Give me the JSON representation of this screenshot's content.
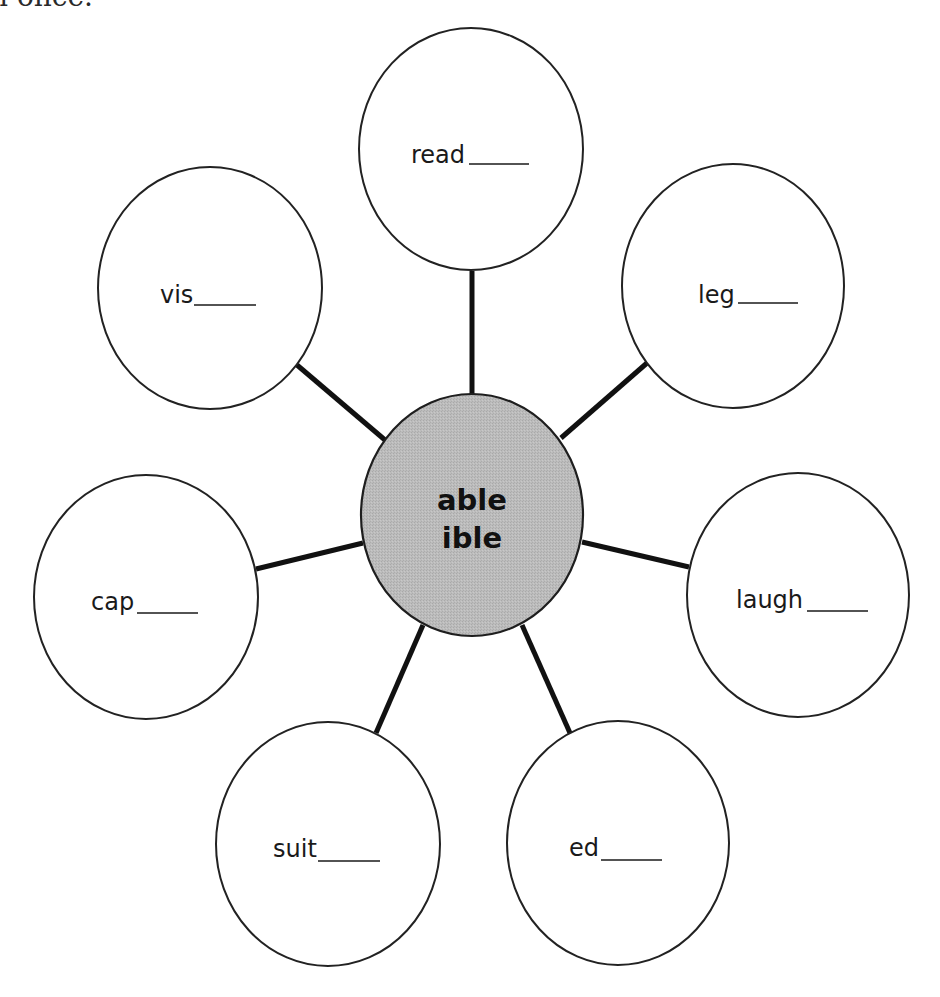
{
  "page": {
    "top_fragment_text": "n once."
  },
  "diagram": {
    "type": "word-web",
    "center": {
      "lines": [
        "able",
        "ible"
      ],
      "fill_color": "#b8b8b8"
    },
    "leaves": [
      {
        "id": "read",
        "stem": "read",
        "blank": "____"
      },
      {
        "id": "leg",
        "stem": "leg",
        "blank": "____"
      },
      {
        "id": "laugh",
        "stem": "laugh",
        "blank": "____"
      },
      {
        "id": "ed",
        "stem": "ed",
        "blank": "____"
      },
      {
        "id": "suit",
        "stem": "suit",
        "blank": "____"
      },
      {
        "id": "cap",
        "stem": "cap",
        "blank": "____"
      },
      {
        "id": "vis",
        "stem": "vis",
        "blank": "____"
      }
    ]
  }
}
